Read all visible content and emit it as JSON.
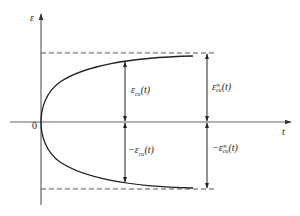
{
  "diagram": {
    "type": "strain-envelope",
    "axes": {
      "y_label": "ε",
      "x_label": "t",
      "origin_label": "0"
    },
    "curves": [
      {
        "name": "upper-branch",
        "description": "ε_cu(t) rising toward asymptote"
      },
      {
        "name": "lower-branch",
        "description": "-ε_cu(t) falling toward negative asymptote"
      }
    ],
    "asymptotes": [
      {
        "name": "upper-limit",
        "style": "dashed",
        "value_label": "ε_cu^∞(t)"
      },
      {
        "name": "lower-limit",
        "style": "dashed",
        "value_label": "-ε_cu^∞(t)"
      }
    ],
    "annotations": {
      "upper_inner": {
        "sym": "ε",
        "sub": "cu",
        "sup": "",
        "arg": "(t)",
        "prefix": ""
      },
      "upper_outer": {
        "sym": "ε",
        "sub": "cu",
        "sup": "∞",
        "arg": "(t)",
        "prefix": ""
      },
      "lower_inner": {
        "sym": "ε",
        "sub": "cu",
        "sup": "",
        "arg": "(t)",
        "prefix": "−"
      },
      "lower_outer": {
        "sym": "ε",
        "sub": "cu",
        "sup": "∞",
        "arg": "(t)",
        "prefix": "−"
      }
    },
    "colors": {
      "line": "#222222",
      "axis": "#444444",
      "dash": "#555555"
    }
  }
}
